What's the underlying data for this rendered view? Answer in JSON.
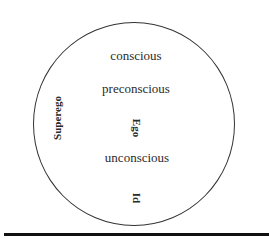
{
  "diagram": {
    "levels": {
      "conscious": "conscious",
      "preconscious": "preconscious",
      "unconscious": "unconscious"
    },
    "structures": {
      "superego": "Superego",
      "ego": "Ego",
      "id": "Id"
    }
  },
  "colors": {
    "line": "#333333",
    "rule": "#111111",
    "text": "#2a2a2a"
  }
}
